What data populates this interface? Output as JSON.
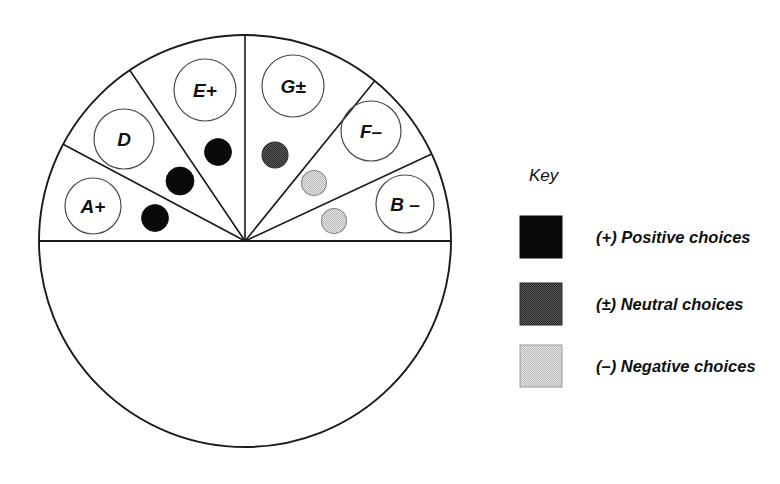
{
  "figure": {
    "title": "",
    "circle": {
      "cx": 245,
      "cy": 241,
      "r": 206,
      "stroke": "#1a1a1a",
      "stroke_width": 1.9,
      "fill": "#ffffff"
    },
    "diameter_line": {
      "label": "horizontal-diameter",
      "x1": 39,
      "y1": 241,
      "x2": 451,
      "y2": 241
    },
    "segments": [
      {
        "id": "A",
        "label": "A+",
        "sign": "+",
        "start_angle": 152,
        "end_angle": 180,
        "label_circle": {
          "cx": 93,
          "cy": 206,
          "r": 28
        }
      },
      {
        "id": "D",
        "label": "D",
        "sign": "",
        "start_angle": 124,
        "end_angle": 152,
        "label_circle": {
          "cx": 124,
          "cy": 139,
          "r": 30
        }
      },
      {
        "id": "E",
        "label": "E+",
        "sign": "+",
        "start_angle": 90,
        "end_angle": 124,
        "label_circle": {
          "cx": 205,
          "cy": 90,
          "r": 31
        }
      },
      {
        "id": "G",
        "label": "G±",
        "sign": "±",
        "start_angle": 51,
        "end_angle": 90,
        "label_circle": {
          "cx": 293,
          "cy": 86,
          "r": 31
        }
      },
      {
        "id": "F",
        "label": "F–",
        "sign": "–",
        "start_angle": 25,
        "end_angle": 51,
        "label_circle": {
          "cx": 371,
          "cy": 131,
          "r": 30
        }
      },
      {
        "id": "B",
        "label": "B –",
        "sign": "–",
        "start_angle": 0,
        "end_angle": 25,
        "label_circle": {
          "cx": 405,
          "cy": 204,
          "r": 29
        }
      }
    ],
    "choice_dots": [
      {
        "type": "positive",
        "segment": "A",
        "cx": 155,
        "cy": 218,
        "r": 13.5
      },
      {
        "type": "positive",
        "segment": "D",
        "cx": 180,
        "cy": 181,
        "r": 14.0
      },
      {
        "type": "positive",
        "segment": "E",
        "cx": 218,
        "cy": 152,
        "r": 13.5
      },
      {
        "type": "neutral",
        "segment": "G",
        "cx": 275,
        "cy": 155,
        "r": 13.0
      },
      {
        "type": "negative",
        "segment": "G",
        "cx": 314,
        "cy": 183,
        "r": 12.5
      },
      {
        "type": "negative",
        "segment": "F",
        "cx": 334,
        "cy": 221,
        "r": 12.5
      }
    ],
    "dot_styles": {
      "positive": {
        "fill": "#0a0a0a",
        "stroke": "#0a0a0a"
      },
      "neutral": {
        "fill": "#4d4d4d",
        "stroke": "#303030"
      },
      "negative": {
        "fill": "#d4d4d4",
        "stroke": "#8a8a8a"
      }
    },
    "segment_line_stroke": "#1a1a1a",
    "label_circle_stroke": "#4a4a4a"
  },
  "key": {
    "title": "Key",
    "title_x": 529,
    "title_y": 181,
    "entries": [
      {
        "label": "(+) Positive choices",
        "swatch_type": "positive",
        "swatch_color": "#0a0a0a",
        "swatch_x": 520,
        "swatch_y": 216,
        "swatch_w": 42,
        "swatch_h": 42,
        "text_x": 596,
        "text_y": 243
      },
      {
        "label": "(±) Neutral choices",
        "swatch_type": "neutral",
        "swatch_color": "#4d4d4d",
        "swatch_x": 520,
        "swatch_y": 283,
        "swatch_w": 42,
        "swatch_h": 42,
        "text_x": 596,
        "text_y": 310
      },
      {
        "label": "(–) Negative choices",
        "swatch_type": "negative",
        "swatch_color": "#d4d4d4",
        "swatch_x": 520,
        "swatch_y": 345,
        "swatch_w": 42,
        "swatch_h": 42,
        "text_x": 596,
        "text_y": 372
      }
    ]
  }
}
